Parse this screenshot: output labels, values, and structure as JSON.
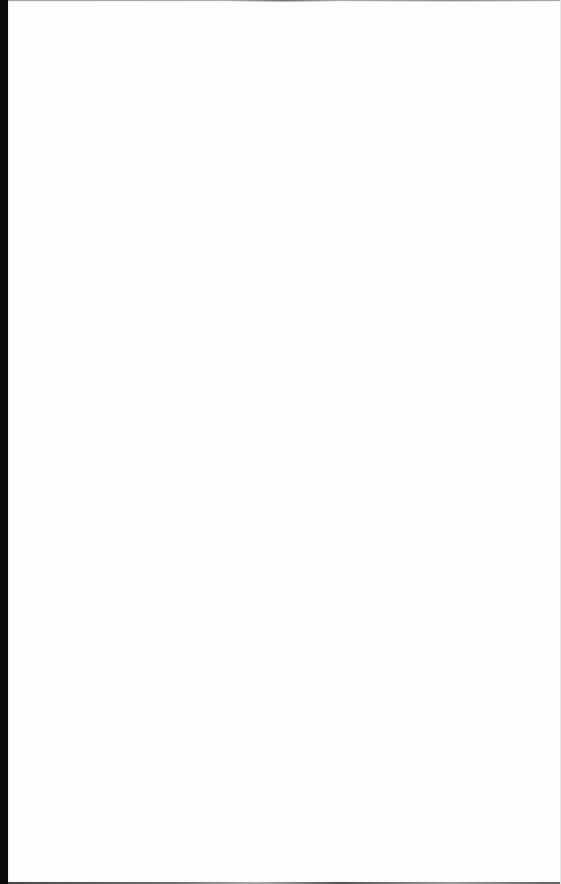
{
  "document": {
    "type": "blank-page",
    "content": "",
    "colors": {
      "page": "#fdfdfd",
      "background_edge": "#0a0a0a"
    }
  }
}
